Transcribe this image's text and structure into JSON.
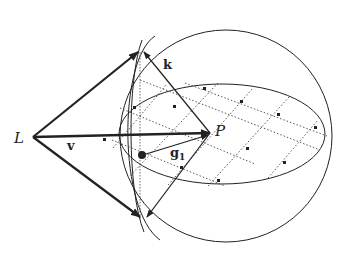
{
  "diagram": {
    "type": "geometric-figure",
    "labels": {
      "L": "L",
      "P": "P",
      "v": "v",
      "k": "k",
      "g1_base": "g",
      "g1_sub": "1"
    },
    "colors": {
      "stroke": "#222222",
      "grid": "#444444",
      "background": "#ffffff"
    },
    "elements": [
      {
        "id": "sphere-outline",
        "kind": "circle"
      },
      {
        "id": "equator-ellipse",
        "kind": "ellipse"
      },
      {
        "id": "cone-boundary-circle",
        "kind": "ellipse-arc"
      },
      {
        "id": "lattice-grid",
        "kind": "dotted-lines",
        "points": 11
      },
      {
        "id": "vector-v",
        "kind": "arrow",
        "from": "L",
        "to": "P"
      },
      {
        "id": "vector-k",
        "kind": "line",
        "from": "P",
        "to": "cone-top"
      },
      {
        "id": "vector-g1",
        "kind": "arrow",
        "from": "lattice-point",
        "to": "P"
      },
      {
        "id": "cone-top-edge",
        "kind": "arrow",
        "from": "L",
        "to": "cone-top"
      },
      {
        "id": "cone-bottom-edge",
        "kind": "arrow",
        "from": "L",
        "to": "cone-bottom"
      }
    ]
  }
}
